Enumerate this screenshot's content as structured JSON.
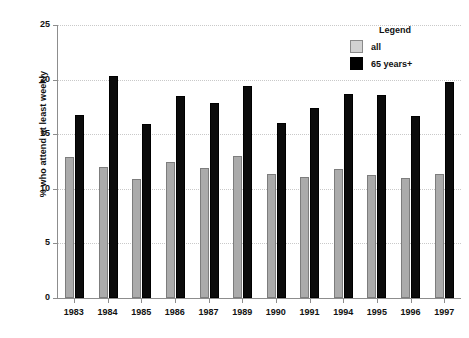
{
  "chart_data": {
    "type": "bar",
    "title": "",
    "xlabel": "",
    "ylabel": "% who attend at least weekly",
    "ylim": [
      0,
      25
    ],
    "yticks": [
      0,
      5,
      10,
      15,
      20,
      25
    ],
    "grid": true,
    "legend_position": "top-right",
    "legend_title": "Legend",
    "categories": [
      "1983",
      "1984",
      "1985",
      "1986",
      "1987",
      "1989",
      "1990",
      "1991",
      "1994",
      "1995",
      "1996",
      "1997"
    ],
    "series": [
      {
        "name": "all",
        "color": "#ababab",
        "values": [
          12.9,
          12.0,
          10.9,
          12.5,
          11.9,
          13.0,
          11.4,
          11.1,
          11.8,
          11.3,
          11.0,
          11.4
        ]
      },
      {
        "name": "65 years+",
        "color": "#000000",
        "values": [
          16.8,
          20.3,
          15.9,
          18.5,
          17.9,
          19.4,
          16.0,
          17.4,
          18.7,
          18.6,
          16.7,
          19.8
        ]
      }
    ]
  },
  "axis": {
    "y_tick_labels": [
      "0",
      "5",
      "10",
      "15",
      "20",
      "25"
    ]
  }
}
